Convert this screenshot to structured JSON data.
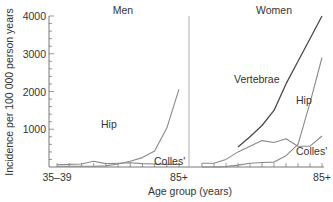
{
  "chart_data": {
    "type": "line",
    "ylabel": "Incidence per 100 000 person years",
    "xlabel": "Age group (years)",
    "ylim": [
      0,
      4000
    ],
    "yticks": [
      "1000",
      "2000",
      "3000",
      "4000"
    ],
    "ytick_values": [
      1000,
      2000,
      3000,
      4000
    ],
    "categories": [
      "35–39",
      "40–44",
      "45–49",
      "50–54",
      "55–59",
      "60–64",
      "65–69",
      "70–74",
      "75–79",
      "80–84",
      "85+"
    ],
    "grid": false,
    "panels": [
      {
        "title": "Men",
        "xtick_labels": [
          "35–39",
          "85+"
        ],
        "series": [
          {
            "name": "Hip",
            "label": "Hip",
            "values": [
              20,
              20,
              20,
              20,
              30,
              80,
              150,
              250,
              420,
              1030,
              2060
            ]
          },
          {
            "name": "Colles'",
            "label": "Colles'",
            "values": [
              60,
              70,
              80,
              150,
              90,
              100,
              110,
              90,
              80,
              70,
              70
            ]
          }
        ]
      },
      {
        "title": "Women",
        "xtick_labels": [
          "85+"
        ],
        "series": [
          {
            "name": "Vertebrae",
            "label": "Vertebrae",
            "values": [
              null,
              null,
              null,
              530,
              800,
              1100,
              1500,
              2200,
              2800,
              3400,
              4000
            ]
          },
          {
            "name": "Hip",
            "label": "Hip",
            "values": [
              0,
              0,
              10,
              50,
              100,
              120,
              130,
              300,
              600,
              1700,
              2900
            ]
          },
          {
            "name": "Colles'",
            "label": "Colles'",
            "values": [
              100,
              100,
              200,
              400,
              550,
              700,
              650,
              750,
              550,
              550,
              820
            ]
          }
        ]
      }
    ]
  },
  "colors": {
    "axis": "#555555",
    "line_light": "#8a8a8a",
    "line_dark": "#4a4a4a",
    "text": "#333333"
  }
}
